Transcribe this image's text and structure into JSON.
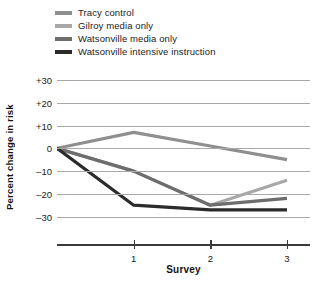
{
  "legend": {
    "position": "top-left",
    "items": [
      {
        "label": "Tracy control",
        "color": "#8f8f8f"
      },
      {
        "label": "Gilroy media only",
        "color": "#a8a8a8"
      },
      {
        "label": "Watsonville media only",
        "color": "#6d6d6d"
      },
      {
        "label": "Watsonville intensive instruction",
        "color": "#2b2b2b"
      }
    ]
  },
  "axes": {
    "ylabel": "Percent change in risk",
    "xlabel": "Survey",
    "yticks": [
      "+30",
      "+20",
      "+10",
      "0",
      "–10",
      "–20",
      "–30"
    ],
    "xticks": [
      "1",
      "2",
      "3"
    ]
  },
  "chart_data": {
    "type": "line",
    "title": "",
    "xlabel": "Survey",
    "ylabel": "Percent change in risk",
    "x": [
      0,
      1,
      2,
      3
    ],
    "xtick_values": [
      1,
      2,
      3
    ],
    "xlim": [
      0,
      3.3
    ],
    "ylim": [
      -35,
      30
    ],
    "ytick_values": [
      30,
      20,
      10,
      0,
      -10,
      -20,
      -30
    ],
    "grid": true,
    "legend_position": "top-left",
    "series": [
      {
        "name": "Tracy control",
        "color": "#8f8f8f",
        "values": [
          0,
          7,
          1,
          -5
        ]
      },
      {
        "name": "Gilroy media only",
        "color": "#a8a8a8",
        "values": [
          0,
          -10,
          -25,
          -14
        ]
      },
      {
        "name": "Watsonville media only",
        "color": "#6d6d6d",
        "values": [
          0,
          -10,
          -25,
          -22
        ]
      },
      {
        "name": "Watsonville intensive instruction",
        "color": "#2b2b2b",
        "values": [
          0,
          -25,
          -27,
          -27
        ]
      }
    ]
  }
}
